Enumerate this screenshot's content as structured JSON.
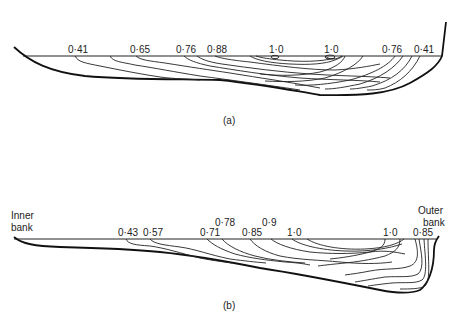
{
  "figure": {
    "panels": [
      {
        "id": "a",
        "caption": "(a)",
        "isovel_labels": [
          "0·41",
          "0·65",
          "0·76",
          "0·88",
          "1·0",
          "1·0",
          "0·76",
          "0·41"
        ]
      },
      {
        "id": "b",
        "caption": "(b)",
        "bank_labels": {
          "inner_line1": "Inner",
          "inner_line2": "bank",
          "outer_line1": "Outer",
          "outer_line2": "bank"
        },
        "isovel_labels": [
          "0·43",
          "0·57",
          "0·71",
          "0·78",
          "0·85",
          "0·9",
          "1·0",
          "1·0",
          "0·85"
        ]
      }
    ]
  }
}
